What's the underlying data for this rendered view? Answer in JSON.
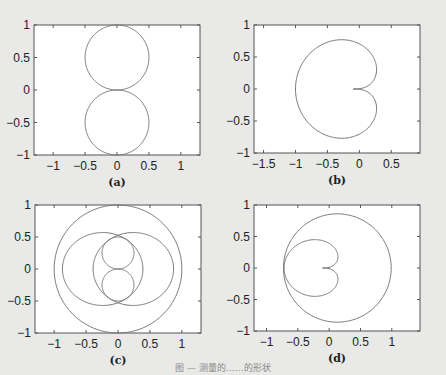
{
  "caption": "图 — 测量的……的形状",
  "chart_data": [
    {
      "type": "line",
      "panel_label": "(a)",
      "title": "",
      "xlabel": "",
      "ylabel": "",
      "xlim": [
        -1.3,
        1.3
      ],
      "ylim": [
        -1,
        1
      ],
      "xticks": [
        "-1",
        "-0.5",
        "0",
        "0.5",
        "1"
      ],
      "yticks": [
        "1",
        "0.5",
        "0",
        "-0.5",
        "-1"
      ],
      "series": [
        {
          "name": "upper circle",
          "shape": "circle",
          "center": [
            0,
            0.5
          ],
          "radius": 0.5
        },
        {
          "name": "lower circle",
          "shape": "circle",
          "center": [
            0,
            -0.5
          ],
          "radius": 0.5
        }
      ]
    },
    {
      "type": "line",
      "panel_label": "(b)",
      "xlim": [
        -1.65,
        0.95
      ],
      "ylim": [
        -1,
        1
      ],
      "xticks": [
        "-1.5",
        "-1",
        "-0.5",
        "0",
        "0.5"
      ],
      "yticks": [
        "1",
        "0.5",
        "0",
        "-0.5",
        "-1"
      ],
      "series": [
        {
          "name": "cardioid",
          "shape": "cardioid-left",
          "x_range": [
            -1.0,
            0.27
          ],
          "y_range": [
            -0.77,
            0.77
          ],
          "cusp": [
            0,
            0
          ]
        }
      ]
    },
    {
      "type": "line",
      "panel_label": "(c)",
      "xlim": [
        -1.3,
        1.3
      ],
      "ylim": [
        -1,
        1
      ],
      "xticks": [
        "-1",
        "-0.5",
        "0",
        "0.5",
        "1"
      ],
      "yticks": [
        "1",
        "0.5",
        "0",
        "-0.5",
        "-1"
      ],
      "series": [
        {
          "name": "unit circle",
          "shape": "circle",
          "center": [
            0,
            0
          ],
          "radius": 1.0
        },
        {
          "name": "lobes",
          "shape": "two-lobe",
          "x_range": [
            -0.87,
            0.87
          ],
          "y_range": [
            -0.57,
            0.57
          ]
        },
        {
          "name": "figure-eight",
          "shape": "two-circles",
          "radius": 0.25,
          "centers": [
            [
              0,
              0.25
            ],
            [
              0,
              -0.25
            ]
          ]
        }
      ]
    },
    {
      "type": "line",
      "panel_label": "(d)",
      "xlim": [
        -1.2,
        1.45
      ],
      "ylim": [
        -1,
        1
      ],
      "xticks": [
        "-1",
        "-0.5",
        "0",
        "0.5",
        "1"
      ],
      "yticks": [
        "1",
        "0.5",
        "0",
        "-0.5",
        "-1"
      ],
      "series": [
        {
          "name": "outer circle",
          "shape": "circle",
          "center": [
            0.13,
            0
          ],
          "radius": 0.86
        },
        {
          "name": "cardioid",
          "shape": "cardioid-left",
          "x_range": [
            -0.72,
            0.14
          ],
          "y_range": [
            -0.45,
            0.45
          ],
          "cusp": [
            0,
            0
          ]
        }
      ]
    }
  ]
}
